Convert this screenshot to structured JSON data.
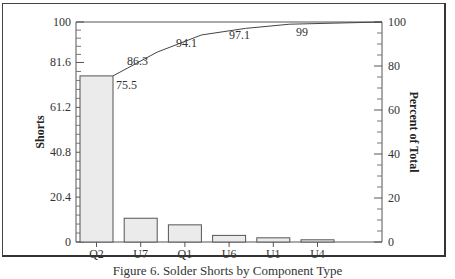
{
  "chart_data": {
    "type": "bar",
    "subtype": "pareto",
    "title": "",
    "caption": "Figure 6. Solder Shorts by Component Type",
    "categories": [
      "Q2",
      "U7",
      "Q1",
      "U6",
      "U1",
      "U4"
    ],
    "series": [
      {
        "name": "Shorts",
        "type": "bar",
        "axis": "left",
        "values": [
          75.5,
          10.8,
          7.8,
          3.0,
          1.9,
          1.0
        ]
      },
      {
        "name": "Percent of Total (cumulative)",
        "type": "line",
        "axis": "right",
        "values": [
          75.5,
          86.3,
          94.1,
          97.1,
          99,
          100
        ]
      }
    ],
    "line_labels": [
      "75.5",
      "86.3",
      "94.1",
      "97.1",
      "99"
    ],
    "xlabel": "",
    "ylabel": "Shorts",
    "y2label": "Percent of Total",
    "ylim": [
      0,
      100
    ],
    "y2lim": [
      0,
      100
    ],
    "yticks": [
      "0",
      "20.4",
      "40.8",
      "61.2",
      "81.6",
      "100"
    ],
    "y2ticks": [
      "0",
      "20",
      "40",
      "60",
      "80",
      "100"
    ],
    "grid": false,
    "legend": "none",
    "colors": {
      "bar_fill": "#ebebeb",
      "bar_stroke": "#555555",
      "line": "#444444"
    }
  }
}
